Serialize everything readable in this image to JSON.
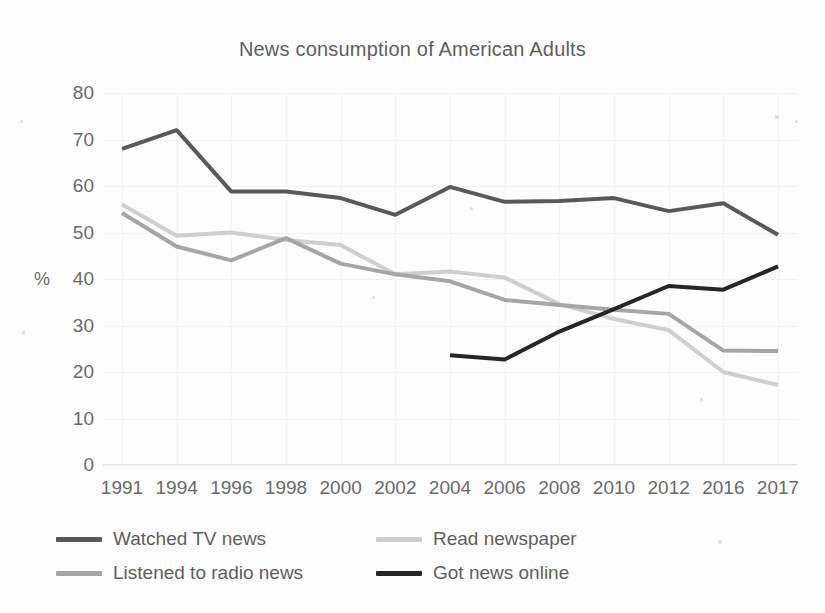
{
  "chart_data": {
    "type": "line",
    "title": "News consumption of American Adults",
    "xlabel": "",
    "ylabel": "%",
    "ylim": [
      0,
      80
    ],
    "ytick_step": 10,
    "yticks": [
      80,
      70,
      60,
      50,
      40,
      30,
      20,
      10,
      0
    ],
    "grid": true,
    "legend_position": "bottom",
    "categories": [
      "1991",
      "1994",
      "1996",
      "1998",
      "2000",
      "2002",
      "2004",
      "2006",
      "2008",
      "2010",
      "2012",
      "2016",
      "2017"
    ],
    "series": [
      {
        "name": "Watched TV news",
        "color": "#595959",
        "width": 4,
        "values": [
          68,
          72,
          58.8,
          58.8,
          57.4,
          53.8,
          59.8,
          56.6,
          56.8,
          57.4,
          54.6,
          56.3,
          49.5
        ]
      },
      {
        "name": "Read newspaper",
        "color": "#cfcfcf",
        "width": 4,
        "values": [
          56,
          49.3,
          50,
          48.4,
          47.3,
          41,
          41.6,
          40.3,
          34.6,
          31.4,
          29,
          20,
          17.2
        ]
      },
      {
        "name": "Listened to radio news",
        "color": "#a6a6a6",
        "width": 4,
        "values": [
          54.2,
          47,
          44,
          48.8,
          43.3,
          41,
          39.5,
          35.5,
          34.4,
          33.4,
          32.5,
          24.6,
          24.5
        ]
      },
      {
        "name": "Got news online",
        "color": "#262626",
        "width": 4,
        "values": [
          null,
          null,
          null,
          null,
          null,
          null,
          23.6,
          22.7,
          28.7,
          33.5,
          38.5,
          37.7,
          42.7
        ]
      }
    ]
  },
  "legend": {
    "items": [
      {
        "label": "Watched TV news",
        "color": "#595959"
      },
      {
        "label": "Read newspaper",
        "color": "#cfcfcf"
      },
      {
        "label": "Listened to radio news",
        "color": "#a6a6a6"
      },
      {
        "label": "Got news online",
        "color": "#262626"
      }
    ]
  }
}
